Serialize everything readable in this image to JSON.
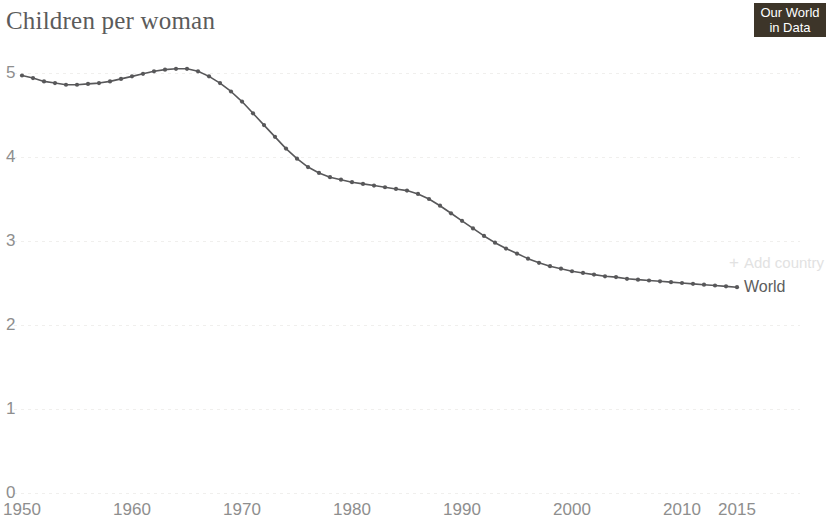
{
  "header": {
    "title": "Children per woman",
    "logo": {
      "name": "our-world-in-data-logo",
      "line1": "Our World",
      "line2": "in Data",
      "background": "#3d3529",
      "text_color": "#ffffff"
    }
  },
  "legend": {
    "series_label": "World",
    "add_country_label": "Add country",
    "add_country_icon": "plus-icon"
  },
  "colors": {
    "line": "#58585a",
    "marker": "#58585a",
    "gridline": "#f0efed",
    "axis_text": "#8e8e8e",
    "title_text": "#5b5b5b",
    "muted_control": "#e2e2e2",
    "background": "#ffffff"
  },
  "chart_data": {
    "type": "line",
    "title": "Children per woman",
    "xlabel": "",
    "ylabel": "",
    "xlim": [
      1950,
      2015
    ],
    "ylim": [
      0,
      5.3
    ],
    "grid": true,
    "grid_style": "dashed-horizontal",
    "legend_position": "end-of-line",
    "markers": true,
    "y_ticks": [
      0,
      1,
      2,
      3,
      4,
      5
    ],
    "y_tick_labels": [
      "0",
      "1",
      "2",
      "3",
      "4",
      "5"
    ],
    "x_ticks": [
      1950,
      1960,
      1970,
      1980,
      1990,
      2000,
      2010,
      2015
    ],
    "x_tick_labels": [
      "1950",
      "1960",
      "1970",
      "1980",
      "1990",
      "2000",
      "2010",
      "2015"
    ],
    "series": [
      {
        "name": "World",
        "color": "#58585a",
        "x": [
          1950,
          1951,
          1952,
          1953,
          1954,
          1955,
          1956,
          1957,
          1958,
          1959,
          1960,
          1961,
          1962,
          1963,
          1964,
          1965,
          1966,
          1967,
          1968,
          1969,
          1970,
          1971,
          1972,
          1973,
          1974,
          1975,
          1976,
          1977,
          1978,
          1979,
          1980,
          1981,
          1982,
          1983,
          1984,
          1985,
          1986,
          1987,
          1988,
          1989,
          1990,
          1991,
          1992,
          1993,
          1994,
          1995,
          1996,
          1997,
          1998,
          1999,
          2000,
          2001,
          2002,
          2003,
          2004,
          2005,
          2006,
          2007,
          2008,
          2009,
          2010,
          2011,
          2012,
          2013,
          2014,
          2015
        ],
        "values": [
          4.97,
          4.94,
          4.9,
          4.88,
          4.86,
          4.86,
          4.87,
          4.88,
          4.9,
          4.93,
          4.96,
          4.99,
          5.02,
          5.04,
          5.05,
          5.05,
          5.02,
          4.96,
          4.88,
          4.78,
          4.66,
          4.52,
          4.38,
          4.24,
          4.1,
          3.98,
          3.88,
          3.81,
          3.76,
          3.73,
          3.7,
          3.68,
          3.66,
          3.64,
          3.62,
          3.6,
          3.56,
          3.5,
          3.42,
          3.33,
          3.24,
          3.15,
          3.06,
          2.98,
          2.91,
          2.85,
          2.79,
          2.74,
          2.7,
          2.67,
          2.64,
          2.62,
          2.6,
          2.58,
          2.57,
          2.55,
          2.54,
          2.53,
          2.52,
          2.51,
          2.5,
          2.49,
          2.48,
          2.47,
          2.46,
          2.45
        ]
      }
    ]
  }
}
